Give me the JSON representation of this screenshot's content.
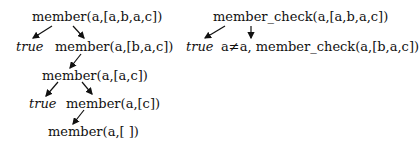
{
  "left_tree": {
    "root": "member(a,[a,b,a,c])",
    "level1": {
      "left": "true",
      "right": "member(a,[b,a,c])"
    },
    "level2": {
      "node": "member(a,[a,c])"
    },
    "level3": {
      "left": "true",
      "right": "member(a,[c])"
    },
    "level4": {
      "node": "member(a,[ ])"
    }
  },
  "right_tree": {
    "root": "member_check(a,[a,b,a,c])",
    "level1": {
      "left": "true",
      "right": "a≠a, member_check(a,[b,a,c])"
    }
  }
}
